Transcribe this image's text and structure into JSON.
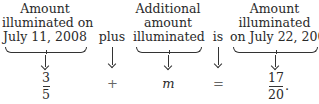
{
  "columns": [
    {
      "label_lines": [
        "Amount",
        "illuminated on",
        "July 11, 2008"
      ],
      "value": {
        "type": "fraction",
        "numerator": "3",
        "denominator": "5"
      }
    },
    {
      "label_lines": [
        "plus"
      ],
      "value": {
        "type": "symbol",
        "text": "+"
      }
    },
    {
      "label_lines": [
        "Additional",
        "amount",
        "illuminated"
      ],
      "value": {
        "type": "variable",
        "text": "m"
      }
    },
    {
      "label_lines": [
        "is"
      ],
      "value": {
        "type": "symbol",
        "text": "="
      }
    },
    {
      "label_lines": [
        "Amount",
        "illuminated",
        "on July 22, 2008"
      ],
      "value": {
        "type": "fraction",
        "numerator": "17",
        "denominator": "20",
        "trailing": "."
      }
    }
  ]
}
